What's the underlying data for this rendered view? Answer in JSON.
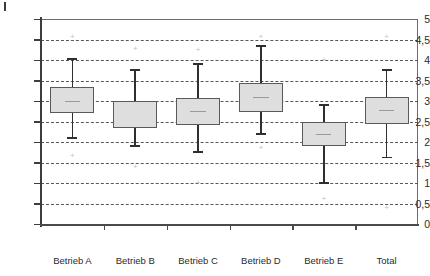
{
  "chart_data": {
    "type": "box",
    "title": "",
    "xlabel": "",
    "ylabel": "",
    "ylim": [
      0,
      5
    ],
    "yticks": [
      0,
      0.5,
      1,
      1.5,
      2,
      2.5,
      3,
      3.5,
      4,
      4.5,
      5
    ],
    "ytick_labels": [
      "0",
      "0,5",
      "1",
      "1,5",
      "2",
      "2,5",
      "3",
      "3,5",
      "4",
      "4,5",
      "5"
    ],
    "grid": true,
    "grid_style": "dashed-horizontal",
    "legend": null,
    "categories": [
      "Betrieb A",
      "Betrieb B",
      "Betrieb C",
      "Betrieb D",
      "Betrieb E",
      "Total"
    ],
    "boxes": [
      {
        "category": "Betrieb A",
        "whisker_low": 2.1,
        "q1": 2.7,
        "median": 3.0,
        "q3": 3.35,
        "whisker_high": 4.02,
        "outliers": [
          4.55,
          1.65
        ]
      },
      {
        "category": "Betrieb B",
        "whisker_low": 1.9,
        "q1": 2.35,
        "median": 3.0,
        "q3": 3.0,
        "whisker_high": 3.75,
        "outliers": [
          4.28,
          1.4
        ]
      },
      {
        "category": "Betrieb C",
        "whisker_low": 1.75,
        "q1": 2.42,
        "median": 2.75,
        "q3": 3.08,
        "whisker_high": 3.9,
        "outliers": [
          4.25,
          1.0
        ]
      },
      {
        "category": "Betrieb D",
        "whisker_low": 2.2,
        "q1": 2.72,
        "median": 3.1,
        "q3": 3.45,
        "whisker_high": 4.35,
        "outliers": [
          4.55,
          1.85
        ]
      },
      {
        "category": "Betrieb E",
        "whisker_low": 1.0,
        "q1": 1.9,
        "median": 2.2,
        "q3": 2.5,
        "whisker_high": 2.9,
        "outliers": [
          4.0,
          0.6
        ]
      },
      {
        "category": "Total",
        "whisker_low": 1.62,
        "q1": 2.45,
        "median": 2.78,
        "q3": 3.1,
        "whisker_high": 3.75,
        "outliers": [
          4.55,
          0.4
        ]
      }
    ],
    "colors": {
      "box_fill": "#dedede",
      "box_border": "#5a5a5a",
      "whisker": "#2f2f2f",
      "median": "#9a9a9a",
      "grid": "#585858",
      "outlier": "#c2c2c2",
      "axis": "#3d3d3d",
      "frame": "#6b6b6b",
      "text": "#2b2b2b",
      "background": "#ffffff"
    },
    "outlier_marker": "+"
  },
  "geometry": {
    "plot_left": 41,
    "plot_right": 418,
    "plot_top": 19,
    "plot_bottom": 224,
    "box_half_width": 22
  }
}
